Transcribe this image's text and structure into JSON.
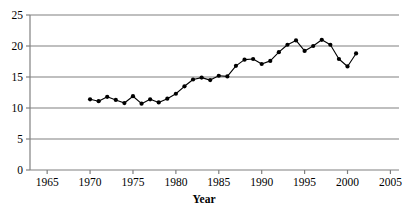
{
  "chart_data": {
    "type": "line",
    "title": "",
    "subtitle": "",
    "xlabel": "Year",
    "ylabel": "",
    "xlim": [
      1963,
      2006
    ],
    "ylim": [
      0,
      25
    ],
    "grid": true,
    "grid_axis": "y",
    "legend": false,
    "legend_position": "none",
    "marker": "filled-circle",
    "line_color": "#000000",
    "marker_color": "#000000",
    "grid_color": "#808080",
    "axis_color": "#808080",
    "background_color": "#ffffff",
    "x_ticks": [
      1965,
      1970,
      1975,
      1980,
      1985,
      1990,
      1995,
      2000,
      2005
    ],
    "x_tick_labels": [
      "1965",
      "1970",
      "1975",
      "1980",
      "1985",
      "1990",
      "1995",
      "2000",
      "2005"
    ],
    "y_ticks": [
      0,
      5,
      10,
      15,
      20,
      25
    ],
    "y_tick_labels": [
      "0",
      "5",
      "10",
      "15",
      "20",
      "25"
    ],
    "x": [
      1970,
      1971,
      1972,
      1973,
      1974,
      1975,
      1976,
      1977,
      1978,
      1979,
      1980,
      1981,
      1982,
      1983,
      1984,
      1985,
      1986,
      1987,
      1988,
      1989,
      1990,
      1991,
      1992,
      1993,
      1994,
      1995,
      1996,
      1997,
      1998,
      1999,
      2000,
      2001
    ],
    "values": [
      11.4,
      11.1,
      11.8,
      11.3,
      10.8,
      11.9,
      10.7,
      11.4,
      10.9,
      11.5,
      12.3,
      13.5,
      14.6,
      14.9,
      14.5,
      15.2,
      15.1,
      16.8,
      17.8,
      17.9,
      17.1,
      17.6,
      19.0,
      20.2,
      20.9,
      19.2,
      20.0,
      21.0,
      20.2,
      17.9,
      16.7,
      18.8
    ],
    "series": [
      {
        "name": "series-1",
        "values": [
          11.4,
          11.1,
          11.8,
          11.3,
          10.8,
          11.9,
          10.7,
          11.4,
          10.9,
          11.5,
          12.3,
          13.5,
          14.6,
          14.9,
          14.5,
          15.2,
          15.1,
          16.8,
          17.8,
          17.9,
          17.1,
          17.6,
          19.0,
          20.2,
          20.9,
          19.2,
          20.0,
          21.0,
          20.2,
          17.9,
          16.7,
          18.8
        ]
      }
    ]
  }
}
